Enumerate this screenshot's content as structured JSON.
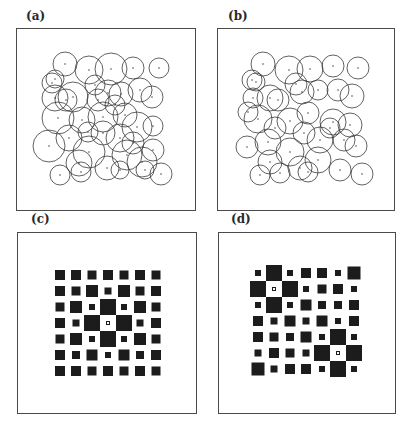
{
  "figure": {
    "panels": [
      {
        "id": "a",
        "label": "(a)",
        "type": "circles",
        "frame": {
          "x": 16,
          "y": 28,
          "w": 180,
          "h": 183
        },
        "label_pos": {
          "x": 26,
          "y": 9
        },
        "stroke": "#3a3a3a",
        "circles": [
          [
            65,
            64,
            12
          ],
          [
            89,
            70,
            14
          ],
          [
            111,
            69,
            16
          ],
          [
            133,
            68,
            11
          ],
          [
            159,
            68,
            10
          ],
          [
            55,
            79,
            9
          ],
          [
            52,
            83,
            10
          ],
          [
            55,
            98,
            13
          ],
          [
            73,
            97,
            15
          ],
          [
            95,
            85,
            10
          ],
          [
            108,
            93,
            13
          ],
          [
            121,
            94,
            12
          ],
          [
            140,
            90,
            12
          ],
          [
            152,
            97,
            11
          ],
          [
            58,
            118,
            16
          ],
          [
            82,
            120,
            13
          ],
          [
            103,
            117,
            15
          ],
          [
            125,
            115,
            12
          ],
          [
            137,
            127,
            15
          ],
          [
            153,
            126,
            10
          ],
          [
            49,
            146,
            16
          ],
          [
            69,
            138,
            13
          ],
          [
            89,
            152,
            16
          ],
          [
            103,
            133,
            12
          ],
          [
            120,
            138,
            14
          ],
          [
            153,
            150,
            11
          ],
          [
            142,
            162,
            15
          ],
          [
            79,
            163,
            13
          ],
          [
            107,
            168,
            12
          ],
          [
            127,
            155,
            15
          ],
          [
            60,
            175,
            10
          ],
          [
            81,
            172,
            10
          ],
          [
            120,
            170,
            9
          ],
          [
            161,
            174,
            11
          ],
          [
            145,
            170,
            9
          ],
          [
            66,
            100,
            11
          ],
          [
            98,
            100,
            11
          ],
          [
            115,
            105,
            10
          ],
          [
            88,
            132,
            10
          ],
          [
            133,
            143,
            11
          ]
        ]
      },
      {
        "id": "b",
        "label": "(b)",
        "type": "circles",
        "frame": {
          "x": 217,
          "y": 28,
          "w": 178,
          "h": 183
        },
        "label_pos": {
          "x": 228,
          "y": 9
        },
        "stroke": "#3a3a3a",
        "circles": [
          [
            263,
            64,
            12
          ],
          [
            289,
            70,
            14
          ],
          [
            310,
            69,
            13
          ],
          [
            333,
            66,
            11
          ],
          [
            358,
            68,
            11
          ],
          [
            252,
            80,
            10
          ],
          [
            256,
            82,
            9
          ],
          [
            253,
            98,
            10
          ],
          [
            270,
            98,
            13
          ],
          [
            296,
            84,
            11
          ],
          [
            302,
            92,
            12
          ],
          [
            318,
            90,
            10
          ],
          [
            338,
            90,
            11
          ],
          [
            352,
            96,
            12
          ],
          [
            258,
            119,
            14
          ],
          [
            290,
            121,
            13
          ],
          [
            308,
            113,
            11
          ],
          [
            333,
            122,
            13
          ],
          [
            350,
            125,
            12
          ],
          [
            247,
            147,
            11
          ],
          [
            268,
            142,
            13
          ],
          [
            290,
            152,
            14
          ],
          [
            304,
            133,
            11
          ],
          [
            320,
            140,
            13
          ],
          [
            344,
            140,
            11
          ],
          [
            356,
            146,
            11
          ],
          [
            270,
            162,
            12
          ],
          [
            300,
            168,
            12
          ],
          [
            318,
            160,
            13
          ],
          [
            260,
            175,
            10
          ],
          [
            280,
            173,
            10
          ],
          [
            308,
            172,
            10
          ],
          [
            340,
            170,
            11
          ],
          [
            362,
            174,
            11
          ],
          [
            330,
            128,
            10
          ],
          [
            275,
            128,
            11
          ],
          [
            248,
            112,
            10
          ],
          [
            278,
            100,
            11
          ]
        ]
      },
      {
        "id": "c",
        "label": "(c)",
        "type": "squares",
        "frame": {
          "x": 17,
          "y": 232,
          "w": 180,
          "h": 182
        },
        "label_pos": {
          "x": 31,
          "y": 212
        },
        "fill": "#1c1c1c",
        "grid": {
          "origin_x": 60,
          "origin_y": 275,
          "pitch": 16,
          "rows": 7,
          "cols": 7
        },
        "sizes": [
          [
            10,
            10,
            9,
            10,
            9,
            10,
            9
          ],
          [
            10,
            9,
            12,
            7,
            12,
            9,
            10
          ],
          [
            9,
            12,
            6,
            16,
            6,
            12,
            9
          ],
          [
            10,
            7,
            16,
            3,
            16,
            7,
            10
          ],
          [
            9,
            12,
            6,
            16,
            6,
            12,
            9
          ],
          [
            10,
            8,
            11,
            6,
            11,
            8,
            10
          ],
          [
            10,
            10,
            9,
            10,
            9,
            10,
            9
          ]
        ],
        "hollow": [
          [
            3,
            3
          ]
        ]
      },
      {
        "id": "d",
        "label": "(d)",
        "type": "squares",
        "frame": {
          "x": 218,
          "y": 232,
          "w": 178,
          "h": 182
        },
        "label_pos": {
          "x": 231,
          "y": 212
        },
        "fill": "#1c1c1c",
        "grid": {
          "origin_x": 258,
          "origin_y": 273,
          "pitch": 16,
          "rows": 7,
          "cols": 7
        },
        "sizes": [
          [
            6,
            16,
            6,
            10,
            10,
            6,
            13
          ],
          [
            16,
            3,
            16,
            6,
            9,
            10,
            6
          ],
          [
            6,
            16,
            6,
            11,
            8,
            8,
            10
          ],
          [
            10,
            7,
            11,
            7,
            11,
            6,
            10
          ],
          [
            10,
            9,
            8,
            11,
            6,
            16,
            6
          ],
          [
            7,
            10,
            9,
            7,
            16,
            3,
            16
          ],
          [
            13,
            7,
            10,
            10,
            6,
            16,
            6
          ]
        ],
        "hollow": [
          [
            1,
            1
          ],
          [
            5,
            5
          ]
        ]
      }
    ]
  }
}
